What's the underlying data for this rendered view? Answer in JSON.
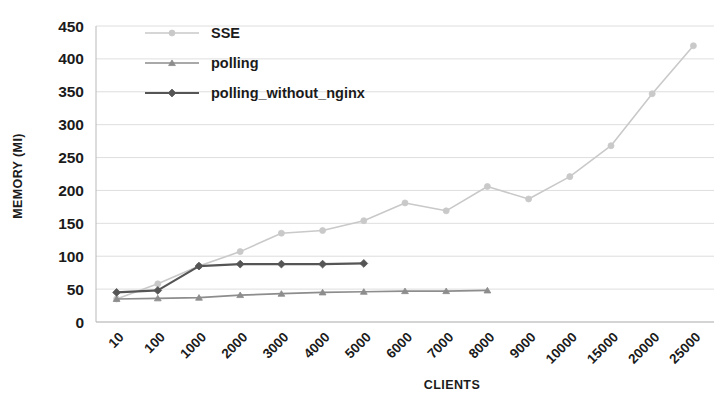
{
  "chart_data": {
    "type": "line",
    "title": "",
    "xlabel": "CLIENTS",
    "ylabel": "MEMORY (MI)",
    "categories": [
      "10",
      "100",
      "1000",
      "2000",
      "3000",
      "4000",
      "5000",
      "6000",
      "7000",
      "8000",
      "9000",
      "10000",
      "15000",
      "20000",
      "25000"
    ],
    "ylim": [
      0,
      450
    ],
    "ytick_values": [
      "0",
      "50",
      "100",
      "150",
      "200",
      "250",
      "300",
      "350",
      "400",
      "450"
    ],
    "grid": true,
    "legend_position": "top-center",
    "series": [
      {
        "name": "SSE",
        "color": "#c9c9c9",
        "marker": "circle",
        "values": [
          35,
          58,
          85,
          107,
          135,
          139,
          154,
          181,
          169,
          206,
          187,
          221,
          268,
          347,
          420
        ]
      },
      {
        "name": "polling",
        "color": "#8d8d8d",
        "marker": "triangle",
        "values": [
          35,
          36,
          37,
          41,
          43,
          45,
          46,
          47,
          47,
          48,
          null,
          null,
          null,
          null,
          null
        ]
      },
      {
        "name": "polling_without_nginx",
        "color": "#555555",
        "marker": "diamond",
        "values": [
          45,
          48,
          85,
          88,
          88,
          88,
          89,
          null,
          null,
          null,
          null,
          null,
          null,
          null,
          null
        ]
      }
    ]
  },
  "legend": {
    "items": [
      {
        "label": "SSE"
      },
      {
        "label": "polling"
      },
      {
        "label": "polling_without_nginx"
      }
    ]
  },
  "axes": {
    "y_title": "MEMORY (MI)",
    "x_title": "CLIENTS"
  }
}
